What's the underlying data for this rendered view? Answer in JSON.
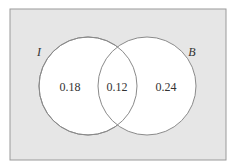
{
  "diagram": {
    "type": "venn",
    "universe": {
      "x": 10,
      "y": 9,
      "width": 216,
      "height": 151,
      "fill": "#e6e6e6",
      "stroke": "#9a9a9a"
    },
    "sets": [
      {
        "label": "I",
        "cx": 88,
        "cy": 86,
        "r": 49,
        "label_x": 39,
        "label_y": 56
      },
      {
        "label": "B",
        "cx": 147,
        "cy": 86,
        "r": 49,
        "label_x": 192,
        "label_y": 56
      }
    ],
    "regions": [
      {
        "name": "I only",
        "value": "0.18",
        "x": 70,
        "y": 91
      },
      {
        "name": "I and B",
        "value": "0.12",
        "x": 117,
        "y": 91
      },
      {
        "name": "B only",
        "value": "0.24",
        "x": 166,
        "y": 91
      }
    ],
    "colors": {
      "circle_fill": "#ffffff",
      "circle_stroke": "#8a8a8a",
      "text": "#333333"
    }
  }
}
